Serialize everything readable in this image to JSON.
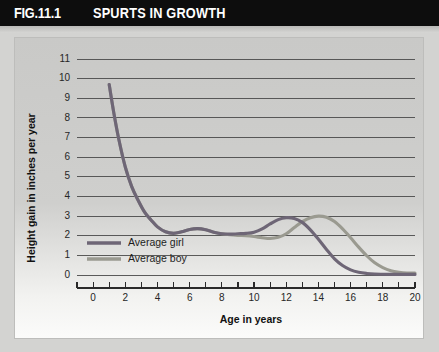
{
  "header": {
    "fig_number": "FIG.11.1",
    "title": "SPURTS IN GROWTH"
  },
  "chart_data": {
    "type": "line",
    "title": "SPURTS IN GROWTH",
    "xlabel": "Age in years",
    "ylabel": "Height gain in inches per year",
    "xlim": [
      -1,
      20
    ],
    "ylim": [
      0,
      11
    ],
    "xticks": [
      0,
      1,
      2,
      3,
      4,
      5,
      6,
      7,
      8,
      9,
      10,
      11,
      12,
      13,
      14,
      15,
      16,
      17,
      18,
      19,
      20
    ],
    "xtick_labels": [
      "0",
      "2",
      "4",
      "6",
      "8",
      "10",
      "12",
      "14",
      "16",
      "18",
      "20"
    ],
    "xtick_label_values": [
      0,
      2,
      4,
      6,
      8,
      10,
      12,
      14,
      16,
      18,
      20
    ],
    "yticks": [
      0,
      1,
      2,
      3,
      4,
      5,
      6,
      7,
      8,
      9,
      10,
      11
    ],
    "ytick_labels": [
      "0",
      "1",
      "2",
      "3",
      "4",
      "5",
      "6",
      "7",
      "8",
      "9",
      "10",
      "11"
    ],
    "grid": true,
    "legend_position": "inside-lower-left",
    "series": [
      {
        "name": "Average girl",
        "color": "#6e6676",
        "x": [
          1.0,
          1.3,
          1.6,
          2.0,
          2.4,
          2.8,
          3.2,
          3.6,
          4.0,
          4.5,
          5.0,
          5.5,
          6.0,
          6.5,
          7.0,
          7.5,
          8.0,
          8.5,
          9.0,
          9.5,
          10.0,
          10.5,
          11.0,
          11.5,
          12.0,
          12.5,
          13.0,
          13.5,
          14.0,
          14.5,
          15.0,
          15.5,
          16.0,
          16.5,
          17.0,
          17.5,
          18.0,
          19.0,
          20.0
        ],
        "y": [
          9.7,
          8.2,
          6.9,
          5.5,
          4.5,
          3.8,
          3.2,
          2.8,
          2.45,
          2.2,
          2.12,
          2.2,
          2.32,
          2.36,
          2.3,
          2.18,
          2.1,
          2.08,
          2.1,
          2.12,
          2.18,
          2.35,
          2.6,
          2.82,
          2.92,
          2.88,
          2.68,
          2.3,
          1.82,
          1.3,
          0.82,
          0.48,
          0.26,
          0.14,
          0.08,
          0.05,
          0.04,
          0.03,
          0.03
        ]
      },
      {
        "name": "Average boy",
        "color": "#9a9a90",
        "x": [
          1.0,
          1.3,
          1.6,
          2.0,
          2.4,
          2.8,
          3.2,
          3.6,
          4.0,
          4.5,
          5.0,
          5.5,
          6.0,
          6.5,
          7.0,
          7.5,
          8.0,
          8.5,
          9.0,
          9.5,
          10.0,
          10.5,
          11.0,
          11.5,
          12.0,
          12.5,
          13.0,
          13.5,
          14.0,
          14.5,
          15.0,
          15.5,
          16.0,
          16.5,
          17.0,
          17.5,
          18.0,
          18.5,
          19.0,
          19.5,
          20.0
        ],
        "y": [
          9.7,
          8.2,
          6.9,
          5.5,
          4.5,
          3.8,
          3.2,
          2.8,
          2.45,
          2.2,
          2.12,
          2.2,
          2.32,
          2.36,
          2.3,
          2.18,
          2.1,
          2.05,
          2.02,
          2.0,
          1.96,
          1.9,
          1.86,
          1.92,
          2.1,
          2.42,
          2.72,
          2.92,
          3.0,
          2.94,
          2.72,
          2.35,
          1.9,
          1.42,
          0.98,
          0.62,
          0.38,
          0.22,
          0.14,
          0.1,
          0.1
        ]
      }
    ],
    "annotations": []
  }
}
